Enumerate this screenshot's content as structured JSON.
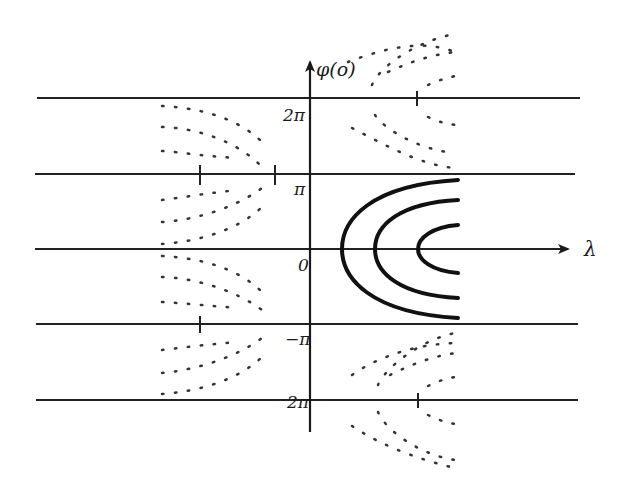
{
  "diagram": {
    "type": "phase-plane",
    "axes": {
      "x_label": "λ",
      "y_label": "φ(o)",
      "origin_label": "0"
    },
    "y_ticks": [
      {
        "label": "2π",
        "value": "2pi"
      },
      {
        "label": "π",
        "value": "pi"
      },
      {
        "label": "0",
        "value": "0"
      },
      {
        "label": "−π",
        "value": "-pi"
      },
      {
        "label": "2π",
        "value": "-2pi"
      }
    ],
    "horizontal_lines": [
      "2π",
      "π",
      "0",
      "−π",
      "−2π"
    ],
    "solid_curves": {
      "count": 3,
      "description": "nested parabolic arcs opening to the right, centered on φ=0"
    },
    "dotted_curves": {
      "left_region": "hyperbola-like families centered near φ=±π (λ<0)",
      "right_region": "families centered near φ=±2π (λ>0)"
    },
    "colors": {
      "ink": "#1a1a1a",
      "background": "#ffffff"
    }
  }
}
